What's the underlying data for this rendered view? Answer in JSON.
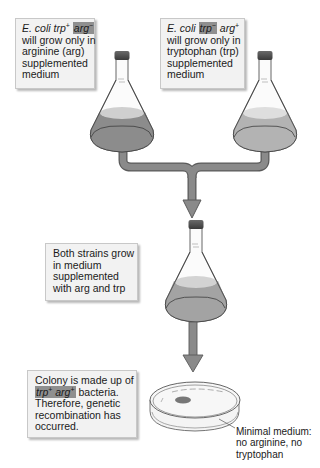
{
  "diagram": {
    "type": "flow-diagram",
    "colors": {
      "medium_dark": "#8c8c8c",
      "medium_light": "#b5b5b5",
      "pipe": "#8a8a8a",
      "highlight": "#8f8f8f",
      "box_fill": "#f2f2f2"
    }
  },
  "boxes": {
    "strain_a": {
      "species": "E. coli",
      "gene1": "trp",
      "gene1_sign": "+",
      "gene2": "arg",
      "gene2_sign": "−",
      "lines": [
        "will grow only in",
        "arginine (arg)",
        "supplemented",
        "medium"
      ]
    },
    "strain_b": {
      "species": "E. coli",
      "gene1": "trp",
      "gene1_sign": "−",
      "gene2": "arg",
      "gene2_sign": "+",
      "lines": [
        "will grow only in",
        "tryptophan (trp)",
        "supplemented",
        "medium"
      ]
    },
    "mixed": {
      "lines": [
        "Both strains grow",
        "in medium",
        "supplemented",
        "with arg and trp"
      ]
    },
    "result": {
      "line1": "Colony is made up of",
      "gene1": "trp",
      "gene1_sign": "+",
      "gene2": "arg",
      "gene2_sign": "+",
      "line2_suffix": " bacteria.",
      "lines": [
        "Therefore, genetic",
        "recombination has",
        "occurred."
      ]
    }
  },
  "labels": {
    "plate": [
      "Minimal medium:",
      "no arginine, no",
      "tryptophan"
    ]
  },
  "elements": {
    "flasks": [
      "flask-strain-a",
      "flask-strain-b",
      "flask-mixed"
    ],
    "arrows": [
      "merge-arrow",
      "plate-arrow"
    ],
    "plate": "petri-dish-with-colony"
  }
}
